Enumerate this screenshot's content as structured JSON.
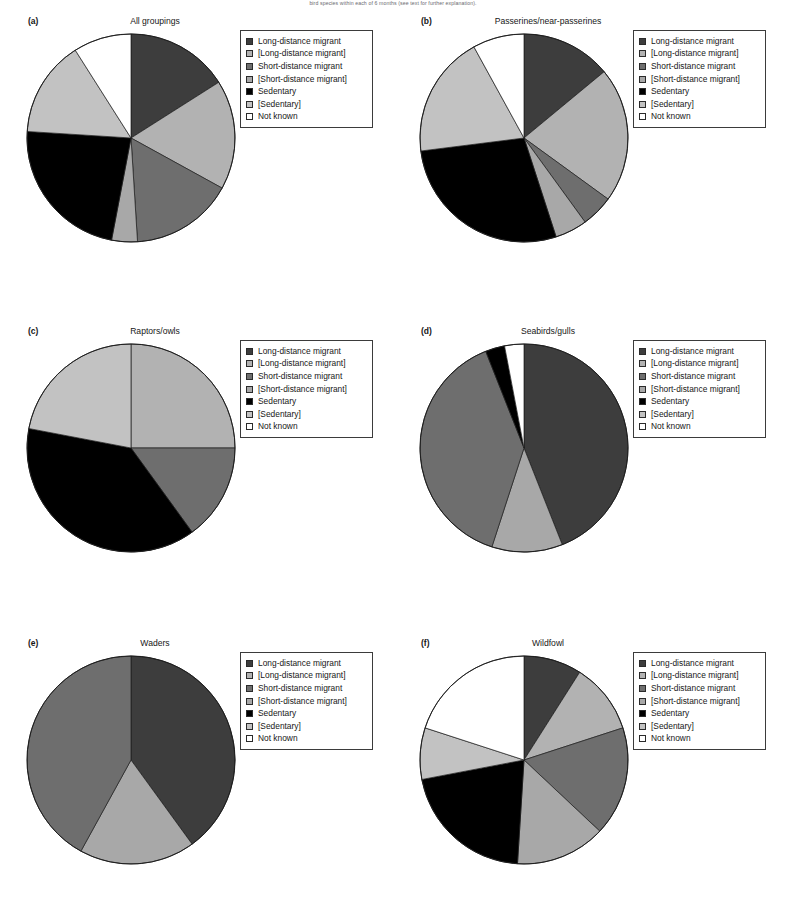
{
  "figure": {
    "caption": "bird species within each of 6 months (see text for further explanation)."
  },
  "legend": {
    "entries": [
      {
        "label": "Long-distance migrant",
        "color": "#3d3d3d",
        "key": "ldm"
      },
      {
        "label": "[Long-distance migrant]",
        "color": "#b2b2b2",
        "key": "ldm_b"
      },
      {
        "label": "Short-distance migrant",
        "color": "#6e6e6e",
        "key": "sdm"
      },
      {
        "label": "[Short-distance migrant]",
        "color": "#a8a8a8",
        "key": "sdm_b"
      },
      {
        "label": "Sedentary",
        "color": "#000000",
        "key": "sed"
      },
      {
        "label": "[Sedentary]",
        "color": "#c2c2c2",
        "key": "sed_b"
      },
      {
        "label": "Not known",
        "color": "#ffffff",
        "key": "nk"
      }
    ]
  },
  "chart_data": [
    {
      "type": "pie",
      "panel": "(a)",
      "title": "All groupings",
      "categories": [
        "Long-distance migrant",
        "[Long-distance migrant]",
        "Short-distance migrant",
        "[Short-distance migrant]",
        "Sedentary",
        "[Sedentary]",
        "Not known"
      ],
      "values": [
        16,
        17,
        16,
        4,
        23,
        15,
        9
      ],
      "colors": [
        "#3d3d3d",
        "#b2b2b2",
        "#6e6e6e",
        "#a8a8a8",
        "#000000",
        "#c2c2c2",
        "#ffffff"
      ],
      "start_angle": 0,
      "direction": "clockwise"
    },
    {
      "type": "pie",
      "panel": "(b)",
      "title": "Passerines/near-passerines",
      "categories": [
        "Long-distance migrant",
        "[Long-distance migrant]",
        "Short-distance migrant",
        "[Short-distance migrant]",
        "Sedentary",
        "[Sedentary]",
        "Not known"
      ],
      "values": [
        14,
        21,
        5,
        5,
        28,
        19,
        8
      ],
      "colors": [
        "#3d3d3d",
        "#b2b2b2",
        "#6e6e6e",
        "#a8a8a8",
        "#000000",
        "#c2c2c2",
        "#ffffff"
      ],
      "start_angle": 0,
      "direction": "clockwise"
    },
    {
      "type": "pie",
      "panel": "(c)",
      "title": "Raptors/owls",
      "categories": [
        "[Long-distance migrant]",
        "Short-distance migrant",
        "Sedentary",
        "[Sedentary]"
      ],
      "values": [
        25,
        15,
        38,
        22
      ],
      "colors": [
        "#b2b2b2",
        "#6e6e6e",
        "#000000",
        "#c2c2c2"
      ],
      "start_angle": 0,
      "direction": "clockwise"
    },
    {
      "type": "pie",
      "panel": "(d)",
      "title": "Seabirds/gulls",
      "categories": [
        "Long-distance migrant",
        "[Short-distance migrant]",
        "[Long-distance migrant]",
        "Sedentary",
        "Not known"
      ],
      "values": [
        44,
        11,
        39,
        3,
        3
      ],
      "colors": [
        "#3d3d3d",
        "#a8a8a8",
        "#6e6e6e",
        "#000000",
        "#ffffff"
      ],
      "start_angle": 0,
      "direction": "clockwise"
    },
    {
      "type": "pie",
      "panel": "(e)",
      "title": "Waders",
      "categories": [
        "Long-distance migrant",
        "[Short-distance migrant]",
        "[Long-distance migrant]"
      ],
      "values": [
        40,
        18,
        42
      ],
      "colors": [
        "#3d3d3d",
        "#a8a8a8",
        "#6e6e6e"
      ],
      "start_angle": 0,
      "direction": "clockwise"
    },
    {
      "type": "pie",
      "panel": "(f)",
      "title": "Wildfowl",
      "categories": [
        "Long-distance migrant",
        "[Long-distance migrant]",
        "Short-distance migrant",
        "[Short-distance migrant]",
        "Sedentary",
        "[Sedentary]",
        "Not known"
      ],
      "values": [
        9,
        11,
        17,
        14,
        21,
        8,
        20
      ],
      "colors": [
        "#3d3d3d",
        "#b2b2b2",
        "#6e6e6e",
        "#a8a8a8",
        "#000000",
        "#c2c2c2",
        "#ffffff"
      ],
      "start_angle": 0,
      "direction": "clockwise"
    }
  ]
}
